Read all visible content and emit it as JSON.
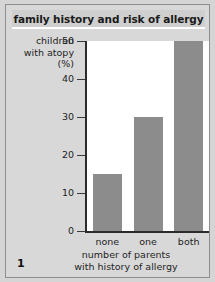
{
  "figure": {
    "title": "family history and risk of allergy",
    "number": "1"
  },
  "chart_data": {
    "type": "bar",
    "title": "family history and risk of allergy",
    "categories": [
      "none",
      "one",
      "both"
    ],
    "values": [
      15,
      30,
      50
    ],
    "xlabel_line1": "number of parents",
    "xlabel_line2": "with history of allergy",
    "ylabel_line1": "children",
    "ylabel_line2": "with atopy",
    "ylabel_line3": "(%)",
    "ylim": [
      0,
      50
    ],
    "yticks": [
      0,
      10,
      20,
      30,
      40,
      50
    ],
    "ytick_labels": [
      "0",
      "10",
      "20",
      "30",
      "40",
      "50"
    ],
    "grid": false,
    "legend": "none",
    "bar_color": "#8c8c8c",
    "plot_background": "#ffffff",
    "panel_background": "#d8d8d8",
    "axis_color": "#2b2b2b"
  }
}
